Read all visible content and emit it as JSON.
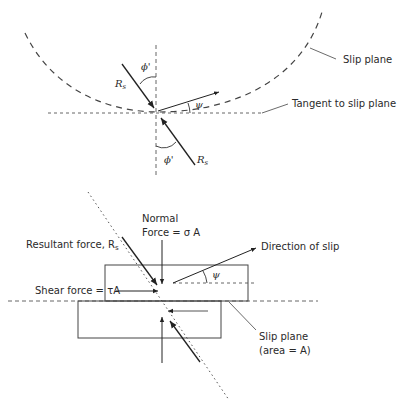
{
  "figure": {
    "top_panel": {
      "labels": {
        "slip_plane": "Slip plane",
        "tangent": "Tangent to slip plane",
        "rs_upper": "R",
        "rs_upper_sub": "s",
        "rs_lower": "R",
        "rs_lower_sub": "s",
        "phi_upper": "ϕ'",
        "phi_lower": "ϕ'",
        "psi": "ψ"
      }
    },
    "bottom_panel": {
      "labels": {
        "normal_line1": "Normal",
        "normal_line2": "Force = σ A",
        "resultant": "Resultant force, R",
        "resultant_sub": "s",
        "direction_of_slip": "Direction of slip",
        "psi": "ψ",
        "shear": "Shear force = τA",
        "slip_plane_line1": "Slip plane",
        "slip_plane_line2": "(area = A)"
      }
    },
    "colors": {
      "line": "#333333",
      "dash": "#555555"
    }
  }
}
